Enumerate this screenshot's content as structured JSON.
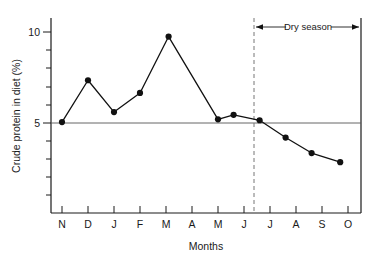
{
  "chart_data": {
    "type": "line",
    "title": "",
    "xlabel": "Months",
    "ylabel": "Crude protein in diet (%)",
    "ylim": [
      0,
      11
    ],
    "xlim": [
      0,
      13
    ],
    "grid": false,
    "reference_line": {
      "value": 5,
      "label": "5"
    },
    "y_ticks_labeled": [
      "5",
      "10"
    ],
    "y_tick_values": [
      5,
      10
    ],
    "y_minor_ticks": [
      1,
      2,
      3,
      4,
      6,
      7,
      8,
      9
    ],
    "categories": [
      "N",
      "D",
      "J",
      "F",
      "M",
      "A",
      "M",
      "J",
      "J",
      "A",
      "S",
      "O"
    ],
    "x_tick_labels": [
      "N",
      "D",
      "J",
      "F",
      "M",
      "A",
      "M",
      "J",
      "J",
      "A",
      "S",
      "O"
    ],
    "series": [
      {
        "name": "Crude protein in diet",
        "points": [
          {
            "x": 1.0,
            "label": "N",
            "y": 5.05
          },
          {
            "x": 2.0,
            "label": "D",
            "y": 7.35
          },
          {
            "x": 3.0,
            "label": "J",
            "y": 5.6
          },
          {
            "x": 4.0,
            "label": "F",
            "y": 6.65
          },
          {
            "x": 5.1,
            "label": "M",
            "y": 9.75
          },
          {
            "x": 7.0,
            "label": "M",
            "y": 5.2
          },
          {
            "x": 7.6,
            "label": "",
            "y": 5.45
          },
          {
            "x": 8.6,
            "label": "J",
            "y": 5.15
          },
          {
            "x": 9.6,
            "label": "J",
            "y": 4.2
          },
          {
            "x": 10.6,
            "label": "A",
            "y": 3.35
          },
          {
            "x": 11.7,
            "label": "S",
            "y": 2.85
          }
        ]
      }
    ],
    "annotations": [
      {
        "name": "dry-season-span",
        "text": "Dry season",
        "start_x": 8.25,
        "end_x": 12.6,
        "style": "double-arrow",
        "divider": {
          "x": 8.25,
          "style": "dashed-vertical"
        }
      }
    ],
    "colors": {
      "line": "#111111",
      "marker": "#111111",
      "axis": "#1a1a1a",
      "reference": "#555555",
      "dashed_divider": "#777777"
    }
  },
  "labels": {
    "y_axis_title": "Crude protein in diet (%)",
    "x_axis_title": "Months",
    "dry_season": "Dry season",
    "y_tick_10": "10",
    "y_tick_5": "5"
  }
}
